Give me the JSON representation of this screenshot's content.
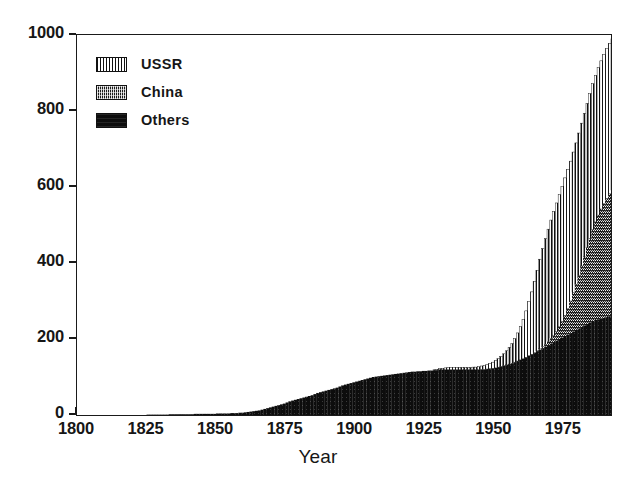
{
  "chart_data": {
    "type": "bar",
    "subtype": "stacked-bar",
    "title": "",
    "xlabel": "Year",
    "ylabel": "",
    "xlim": [
      1800,
      1992
    ],
    "ylim": [
      0,
      1000
    ],
    "grid": false,
    "legend_position": "top-left",
    "x_tick_labels": [
      "1800",
      "1825",
      "1850",
      "1875",
      "1900",
      "1925",
      "1950",
      "1975"
    ],
    "x_ticks": [
      1800,
      1825,
      1850,
      1875,
      1900,
      1925,
      1950,
      1975
    ],
    "y_tick_labels": [
      "0",
      "200",
      "400",
      "600",
      "800",
      "1000"
    ],
    "y_ticks": [
      0,
      200,
      400,
      600,
      800,
      1000
    ],
    "series": [
      {
        "name": "Others",
        "pattern": "solid-black",
        "color": "#0d0d0d",
        "values": [
          0,
          0,
          0,
          0,
          0,
          0,
          0,
          0,
          0,
          0,
          0,
          0,
          0,
          0,
          0,
          0,
          0,
          0,
          0,
          0,
          0,
          0,
          0,
          0,
          0,
          1,
          1,
          1,
          1,
          1,
          1,
          1,
          1,
          2,
          2,
          2,
          2,
          2,
          2,
          2,
          2,
          2,
          3,
          3,
          3,
          3,
          3,
          3,
          3,
          3,
          4,
          4,
          4,
          4,
          4,
          5,
          5,
          5,
          6,
          6,
          7,
          8,
          9,
          10,
          11,
          12,
          14,
          16,
          18,
          20,
          22,
          24,
          26,
          28,
          30,
          33,
          36,
          38,
          40,
          42,
          44,
          46,
          48,
          50,
          52,
          55,
          58,
          60,
          62,
          64,
          66,
          68,
          70,
          72,
          75,
          78,
          80,
          82,
          84,
          86,
          88,
          90,
          92,
          94,
          96,
          98,
          100,
          101,
          102,
          103,
          104,
          105,
          106,
          107,
          108,
          109,
          110,
          111,
          112,
          113,
          114,
          114,
          115,
          115,
          116,
          116,
          117,
          117,
          118,
          118,
          119,
          119,
          119,
          119,
          119,
          119,
          119,
          119,
          119,
          119,
          119,
          119,
          119,
          119,
          119,
          120,
          120,
          121,
          122,
          123,
          124,
          126,
          128,
          130,
          132,
          134,
          136,
          139,
          142,
          145,
          148,
          152,
          156,
          160,
          164,
          168,
          172,
          176,
          180,
          184,
          188,
          192,
          196,
          200,
          204,
          208,
          212,
          216,
          220,
          224,
          228,
          232,
          236,
          240,
          244,
          248,
          250,
          252,
          254,
          256,
          258,
          260,
          262
        ]
      },
      {
        "name": "China",
        "pattern": "dense-hatch",
        "color": "#1a1a1a",
        "values": [
          0,
          0,
          0,
          0,
          0,
          0,
          0,
          0,
          0,
          0,
          0,
          0,
          0,
          0,
          0,
          0,
          0,
          0,
          0,
          0,
          0,
          0,
          0,
          0,
          0,
          0,
          0,
          0,
          0,
          0,
          0,
          0,
          0,
          0,
          0,
          0,
          0,
          0,
          0,
          0,
          0,
          0,
          0,
          0,
          0,
          0,
          0,
          0,
          0,
          0,
          0,
          0,
          0,
          0,
          0,
          0,
          0,
          0,
          0,
          0,
          0,
          0,
          0,
          0,
          0,
          0,
          0,
          0,
          0,
          0,
          0,
          0,
          0,
          0,
          0,
          0,
          0,
          0,
          0,
          0,
          0,
          0,
          0,
          0,
          0,
          0,
          0,
          0,
          0,
          0,
          0,
          0,
          0,
          0,
          0,
          0,
          0,
          0,
          0,
          0,
          0,
          0,
          0,
          0,
          0,
          0,
          0,
          0,
          0,
          0,
          0,
          0,
          0,
          0,
          0,
          0,
          0,
          0,
          0,
          0,
          0,
          0,
          0,
          0,
          0,
          0,
          0,
          0,
          0,
          0,
          0,
          0,
          0,
          0,
          0,
          0,
          0,
          0,
          0,
          0,
          0,
          0,
          0,
          0,
          0,
          0,
          0,
          0,
          0,
          0,
          0,
          0,
          0,
          0,
          0,
          0,
          0,
          0,
          0,
          0,
          0,
          0,
          0,
          0,
          0,
          1,
          2,
          4,
          6,
          9,
          13,
          18,
          24,
          32,
          42,
          54,
          68,
          84,
          102,
          120,
          140,
          160,
          180,
          200,
          220,
          240,
          258,
          274,
          288,
          300,
          312,
          322,
          330
        ]
      },
      {
        "name": "USSR",
        "pattern": "vertical-stripes",
        "color": "#ffffff",
        "values": [
          0,
          0,
          0,
          0,
          0,
          0,
          0,
          0,
          0,
          0,
          0,
          0,
          0,
          0,
          0,
          0,
          0,
          0,
          0,
          0,
          0,
          0,
          0,
          0,
          0,
          0,
          0,
          0,
          0,
          0,
          0,
          0,
          0,
          0,
          0,
          0,
          0,
          0,
          0,
          0,
          0,
          0,
          0,
          0,
          0,
          0,
          0,
          0,
          0,
          0,
          0,
          0,
          0,
          0,
          0,
          0,
          0,
          0,
          0,
          0,
          0,
          0,
          0,
          0,
          0,
          0,
          0,
          0,
          0,
          0,
          0,
          0,
          0,
          0,
          0,
          0,
          0,
          0,
          0,
          0,
          0,
          0,
          0,
          0,
          0,
          0,
          0,
          0,
          0,
          0,
          0,
          0,
          0,
          0,
          0,
          0,
          0,
          0,
          0,
          0,
          0,
          0,
          0,
          0,
          0,
          0,
          0,
          0,
          0,
          0,
          0,
          0,
          0,
          0,
          0,
          0,
          0,
          0,
          0,
          0,
          0,
          0,
          0,
          0,
          0,
          0,
          0,
          0,
          1,
          2,
          3,
          4,
          5,
          6,
          6,
          6,
          6,
          6,
          6,
          6,
          6,
          6,
          7,
          7,
          8,
          9,
          10,
          12,
          14,
          16,
          19,
          22,
          26,
          31,
          37,
          44,
          52,
          62,
          74,
          88,
          104,
          122,
          142,
          164,
          188,
          212,
          236,
          258,
          278,
          296,
          312,
          326,
          338,
          348,
          356,
          362,
          366,
          368,
          370,
          372,
          374,
          376,
          378,
          380,
          382,
          384,
          386,
          388,
          390,
          392,
          394,
          396,
          398
        ]
      }
    ],
    "x_start_year": 1800,
    "peak_total": 880
  },
  "legend": {
    "items": [
      {
        "label": "USSR",
        "pattern": "vertical-stripes"
      },
      {
        "label": "China",
        "pattern": "dense-hatch"
      },
      {
        "label": "Others",
        "pattern": "solid-black"
      }
    ]
  },
  "axes": {
    "x_title": "Year"
  }
}
